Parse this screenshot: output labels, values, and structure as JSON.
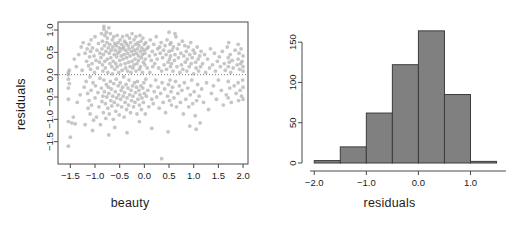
{
  "figure": {
    "width": 519,
    "height": 228,
    "background": "#ffffff",
    "panels": 2
  },
  "chart_data": [
    {
      "id": "scatter-residuals-vs-beauty",
      "type": "scatter",
      "title": "",
      "xlabel": "beauty",
      "ylabel": "residuals",
      "xlim": [
        -1.75,
        2.1
      ],
      "ylim": [
        -2.0,
        1.18
      ],
      "xticks": [
        -1.5,
        -1.0,
        -0.5,
        0.0,
        0.5,
        1.0,
        1.5,
        2.0
      ],
      "xticklabels": [
        "-1.5",
        "-1.0",
        "-0.5",
        "0.0",
        "0.5",
        "1.0",
        "1.5",
        "2.0"
      ],
      "yticks": [
        1.0,
        0.5,
        0.0,
        -0.5,
        -1.0,
        -1.5
      ],
      "yticklabels": [
        "1.0",
        "0.5",
        "0.0",
        "-0.5",
        "-1.0",
        "-1.5"
      ],
      "grid": false,
      "legend": null,
      "point_color": "#a8a8a8",
      "point_opacity": 0.65,
      "point_radius": 1.9,
      "box_frame": true,
      "annotations": [
        {
          "kind": "hline",
          "y": 0.0,
          "style": "dotted",
          "color": "#777777"
        }
      ],
      "n_points": 463,
      "x": [
        -1.54,
        -1.54,
        -1.54,
        -1.54,
        -1.54,
        -1.54,
        -1.54,
        -1.52,
        -1.52,
        -1.5,
        -1.47,
        -1.44,
        -1.42,
        -1.4,
        -1.38,
        -1.36,
        -1.33,
        -1.3,
        -1.28,
        -1.26,
        -1.24,
        -1.22,
        -1.2,
        -1.18,
        -1.17,
        -1.16,
        -1.15,
        -1.14,
        -1.13,
        -1.12,
        -1.12,
        -1.11,
        -1.1,
        -1.1,
        -1.09,
        -1.09,
        -1.08,
        -1.08,
        -1.07,
        -1.06,
        -1.05,
        -1.04,
        -1.03,
        -1.02,
        -1.01,
        -1.0,
        -1.0,
        -0.99,
        -0.98,
        -0.97,
        -0.96,
        -0.95,
        -0.94,
        -0.93,
        -0.92,
        -0.91,
        -0.9,
        -0.9,
        -0.89,
        -0.88,
        -0.87,
        -0.87,
        -0.86,
        -0.86,
        -0.85,
        -0.85,
        -0.84,
        -0.84,
        -0.83,
        -0.83,
        -0.82,
        -0.82,
        -0.81,
        -0.81,
        -0.8,
        -0.8,
        -0.79,
        -0.79,
        -0.78,
        -0.78,
        -0.77,
        -0.77,
        -0.76,
        -0.76,
        -0.75,
        -0.75,
        -0.74,
        -0.74,
        -0.73,
        -0.73,
        -0.72,
        -0.72,
        -0.71,
        -0.71,
        -0.7,
        -0.7,
        -0.69,
        -0.69,
        -0.68,
        -0.68,
        -0.67,
        -0.67,
        -0.66,
        -0.66,
        -0.65,
        -0.65,
        -0.64,
        -0.64,
        -0.63,
        -0.63,
        -0.62,
        -0.62,
        -0.61,
        -0.61,
        -0.6,
        -0.6,
        -0.59,
        -0.59,
        -0.58,
        -0.58,
        -0.57,
        -0.57,
        -0.56,
        -0.56,
        -0.55,
        -0.55,
        -0.54,
        -0.54,
        -0.53,
        -0.53,
        -0.52,
        -0.52,
        -0.51,
        -0.51,
        -0.5,
        -0.5,
        -0.49,
        -0.49,
        -0.48,
        -0.48,
        -0.47,
        -0.47,
        -0.46,
        -0.46,
        -0.45,
        -0.45,
        -0.44,
        -0.44,
        -0.43,
        -0.43,
        -0.42,
        -0.42,
        -0.41,
        -0.41,
        -0.4,
        -0.4,
        -0.39,
        -0.39,
        -0.38,
        -0.38,
        -0.37,
        -0.37,
        -0.36,
        -0.36,
        -0.35,
        -0.35,
        -0.34,
        -0.34,
        -0.33,
        -0.33,
        -0.32,
        -0.32,
        -0.31,
        -0.31,
        -0.3,
        -0.3,
        -0.29,
        -0.29,
        -0.28,
        -0.28,
        -0.27,
        -0.27,
        -0.26,
        -0.26,
        -0.25,
        -0.25,
        -0.24,
        -0.24,
        -0.23,
        -0.23,
        -0.22,
        -0.22,
        -0.21,
        -0.21,
        -0.2,
        -0.2,
        -0.19,
        -0.19,
        -0.18,
        -0.18,
        -0.17,
        -0.17,
        -0.16,
        -0.16,
        -0.15,
        -0.15,
        -0.14,
        -0.14,
        -0.13,
        -0.13,
        -0.12,
        -0.12,
        -0.11,
        -0.11,
        -0.1,
        -0.1,
        -0.09,
        -0.09,
        -0.08,
        -0.08,
        -0.07,
        -0.07,
        -0.06,
        -0.06,
        -0.05,
        -0.05,
        -0.04,
        -0.04,
        -0.03,
        -0.03,
        -0.02,
        -0.02,
        -0.01,
        -0.01,
        0.0,
        0.0,
        0.01,
        0.01,
        0.02,
        0.02,
        0.03,
        0.03,
        0.04,
        0.05,
        0.06,
        0.07,
        0.08,
        0.09,
        0.1,
        0.11,
        0.12,
        0.13,
        0.14,
        0.15,
        0.16,
        0.17,
        0.18,
        0.19,
        0.2,
        0.21,
        0.22,
        0.23,
        0.24,
        0.25,
        0.26,
        0.27,
        0.28,
        0.29,
        0.3,
        0.31,
        0.32,
        0.33,
        0.34,
        0.35,
        0.36,
        0.37,
        0.38,
        0.39,
        0.4,
        0.41,
        0.42,
        0.43,
        0.44,
        0.45,
        0.46,
        0.47,
        0.48,
        0.49,
        0.5,
        0.5,
        0.51,
        0.51,
        0.52,
        0.52,
        0.53,
        0.53,
        0.54,
        0.54,
        0.55,
        0.55,
        0.56,
        0.57,
        0.58,
        0.59,
        0.6,
        0.61,
        0.62,
        0.63,
        0.64,
        0.65,
        0.66,
        0.67,
        0.68,
        0.69,
        0.7,
        0.71,
        0.72,
        0.73,
        0.74,
        0.75,
        0.76,
        0.77,
        0.78,
        0.79,
        0.8,
        0.81,
        0.82,
        0.83,
        0.84,
        0.85,
        0.86,
        0.87,
        0.88,
        0.89,
        0.9,
        0.91,
        0.92,
        0.93,
        0.94,
        0.95,
        0.96,
        0.97,
        0.98,
        0.99,
        1.0,
        1.01,
        1.02,
        1.03,
        1.04,
        1.05,
        1.06,
        1.07,
        1.08,
        1.09,
        1.1,
        1.11,
        1.12,
        1.13,
        1.14,
        1.15,
        1.16,
        1.18,
        1.2,
        1.22,
        1.24,
        1.26,
        1.28,
        1.3,
        1.32,
        1.34,
        1.36,
        1.38,
        1.4,
        1.42,
        1.44,
        1.46,
        1.48,
        1.5,
        1.52,
        1.54,
        1.56,
        1.58,
        1.6,
        1.62,
        1.64,
        1.66,
        1.68,
        1.7,
        1.7,
        1.7,
        1.7,
        1.71,
        1.72,
        1.73,
        1.74,
        1.75,
        1.76,
        1.78,
        1.8,
        1.82,
        1.84,
        1.86,
        1.88,
        1.9,
        1.9,
        1.9,
        1.91,
        1.92,
        1.93,
        1.94,
        1.95,
        1.96,
        1.97,
        1.98,
        1.99,
        2.0,
        2.0,
        2.0,
        2.0,
        2.0,
        1.05,
        0.35,
        -0.82,
        -1.2,
        -0.6,
        0.15,
        0.92,
        -0.35,
        -1.05,
        0.62,
        -0.1,
        0.48,
        -0.72
      ],
      "y": [
        0.05,
        0.0,
        -0.1,
        -0.3,
        -0.55,
        -1.05,
        -1.6,
        0.1,
        -0.2,
        -1.4,
        -1.08,
        -0.95,
        0.35,
        -1.1,
        0.18,
        -0.62,
        0.45,
        -0.45,
        0.62,
        0.1,
        0.72,
        -0.28,
        0.48,
        -0.15,
        0.3,
        0.58,
        -0.42,
        -0.75,
        0.2,
        0.68,
        -0.58,
        0.4,
        -0.05,
        -0.88,
        0.52,
        0.12,
        -0.35,
        0.78,
        -0.68,
        0.25,
        0.6,
        -0.18,
        -1.02,
        0.42,
        0.05,
        -0.52,
        0.85,
        -0.25,
        0.32,
        -0.95,
        0.55,
        0.15,
        -0.4,
        0.7,
        -0.72,
        0.28,
        0.48,
        -0.08,
        -1.12,
        0.38,
        0.92,
        -0.3,
        0.58,
        -0.6,
        0.22,
        0.75,
        -0.48,
        0.08,
        -0.85,
        0.45,
        1.02,
        -0.12,
        0.65,
        -0.38,
        0.3,
        0.88,
        -0.65,
        0.15,
        -0.98,
        0.52,
        0.95,
        -0.22,
        0.72,
        -0.5,
        0.35,
        0.82,
        -0.75,
        0.05,
        -0.28,
        0.6,
        1.05,
        -0.42,
        0.48,
        -0.88,
        0.25,
        0.68,
        -0.15,
        0.92,
        -0.58,
        0.38,
        0.55,
        -0.32,
        0.18,
        -0.7,
        0.78,
        0.02,
        -0.48,
        0.62,
        -1.0,
        0.3,
        0.85,
        -0.2,
        0.45,
        -0.62,
        0.12,
        0.7,
        -0.38,
        0.55,
        -0.82,
        0.25,
        0.65,
        -0.1,
        0.4,
        -0.52,
        0.88,
        0.18,
        -0.68,
        0.48,
        -0.25,
        0.72,
        0.05,
        -0.45,
        0.6,
        -0.9,
        0.32,
        0.52,
        -0.18,
        0.78,
        -0.55,
        0.22,
        0.42,
        -0.35,
        0.68,
        -0.72,
        0.1,
        0.58,
        -0.28,
        0.85,
        -0.48,
        0.35,
        0.62,
        -0.05,
        -0.95,
        0.45,
        0.75,
        -0.4,
        0.25,
        -0.62,
        0.55,
        0.15,
        -0.22,
        0.7,
        -0.78,
        0.38,
        0.88,
        -0.52,
        0.08,
        0.48,
        -0.3,
        0.65,
        -0.68,
        0.28,
        0.58,
        -0.12,
        0.82,
        -0.45,
        0.18,
        0.42,
        -0.85,
        0.72,
        0.05,
        -0.35,
        0.52,
        -0.58,
        0.3,
        0.92,
        -0.25,
        0.62,
        -0.48,
        0.15,
        0.45,
        -0.72,
        0.78,
        0.22,
        -0.18,
        0.55,
        -0.62,
        0.35,
        0.68,
        -0.4,
        0.08,
        0.85,
        -0.28,
        0.48,
        -0.88,
        0.25,
        0.58,
        -0.15,
        0.72,
        -0.55,
        0.32,
        0.42,
        -0.35,
        0.65,
        -0.68,
        0.12,
        0.88,
        -0.45,
        0.52,
        0.18,
        -0.25,
        0.75,
        -0.78,
        0.38,
        0.6,
        -0.52,
        0.05,
        0.45,
        -0.3,
        0.82,
        -0.62,
        0.28,
        0.55,
        -0.18,
        0.68,
        -0.42,
        0.22,
        0.48,
        -0.88,
        0.35,
        0.72,
        -0.1,
        -0.48,
        0.58,
        0.15,
        -0.35,
        0.62,
        -0.72,
        0.42,
        0.05,
        0.78,
        -0.25,
        0.32,
        -0.55,
        0.52,
        0.18,
        -0.65,
        0.68,
        -0.38,
        0.25,
        0.45,
        -0.12,
        0.85,
        -0.5,
        0.35,
        0.58,
        -0.28,
        0.15,
        -0.75,
        0.62,
        0.48,
        -0.42,
        0.72,
        0.08,
        -0.18,
        0.38,
        -0.62,
        0.55,
        0.22,
        -0.32,
        0.65,
        -0.85,
        0.45,
        0.12,
        0.78,
        -0.48,
        0.28,
        -0.22,
        0.95,
        0.52,
        0.35,
        -0.58,
        0.68,
        -0.12,
        0.18,
        0.42,
        -0.38,
        0.72,
        -0.68,
        0.25,
        0.55,
        -0.28,
        0.08,
        0.62,
        -0.52,
        0.32,
        0.45,
        -0.15,
        0.85,
        -0.72,
        0.18,
        0.58,
        -0.42,
        0.38,
        0.68,
        -0.25,
        0.05,
        -0.62,
        0.48,
        0.22,
        -0.35,
        0.75,
        0.12,
        -0.88,
        0.42,
        -0.18,
        0.65,
        0.28,
        -0.55,
        0.52,
        0.08,
        0.35,
        -0.3,
        0.62,
        -0.72,
        0.18,
        0.45,
        -0.45,
        0.72,
        0.25,
        -0.12,
        0.38,
        -0.65,
        0.55,
        0.02,
        -0.38,
        0.48,
        -0.92,
        0.28,
        0.15,
        -0.58,
        0.62,
        -0.22,
        0.35,
        0.08,
        -0.48,
        0.42,
        -1.08,
        0.18,
        0.52,
        -0.32,
        0.25,
        -0.62,
        0.45,
        0.05,
        -0.18,
        0.35,
        -0.78,
        0.15,
        0.58,
        -0.42,
        0.22,
        -0.25,
        0.48,
        0.08,
        -0.55,
        0.3,
        -0.12,
        0.4,
        0.18,
        -0.35,
        0.52,
        -0.68,
        0.25,
        0.1,
        -0.45,
        0.62,
        0.38,
        0.18,
        -0.15,
        -0.52,
        0.72,
        0.28,
        -0.3,
        0.45,
        0.05,
        -0.62,
        0.32,
        0.15,
        -0.25,
        0.55,
        -0.42,
        0.22,
        0.68,
        0.35,
        -0.18,
        -0.58,
        0.48,
        0.12,
        -0.35,
        0.25,
        0.58,
        -0.48,
        0.3,
        -0.12,
        0.42,
        0.18,
        -0.28,
        0.08,
        -0.55,
        -1.22,
        -1.88,
        1.08,
        -1.12,
        -1.18,
        -1.2,
        -1.15,
        -1.3,
        -1.25,
        0.92,
        -1.05,
        -1.28,
        -1.35
      ]
    },
    {
      "id": "histogram-residuals",
      "type": "bar",
      "subtype": "histogram",
      "title": "",
      "xlabel": "residuals",
      "ylabel": "Frequency",
      "xlim": [
        -2.12,
        1.72
      ],
      "ylim": [
        0,
        175
      ],
      "xticks": [
        -2.0,
        -1.0,
        0.0,
        1.0
      ],
      "xticklabels": [
        "-2.0",
        "-1.0",
        "0.0",
        "1.0"
      ],
      "yticks": [
        0,
        50,
        100,
        150
      ],
      "yticklabels": [
        "0",
        "50",
        "100",
        "150"
      ],
      "grid": false,
      "legend": null,
      "bin_width": 0.5,
      "bin_edges": [
        -2.0,
        -1.5,
        -1.0,
        -0.5,
        0.0,
        0.5,
        1.0,
        1.5
      ],
      "categories": [
        "[-2.0,-1.5)",
        "[-1.5,-1.0)",
        "[-1.0,-0.5)",
        "[-0.5,0.0)",
        "[0.0,0.5)",
        "[0.5,1.0)",
        "[1.0,1.5)"
      ],
      "values": [
        3,
        20,
        62,
        122,
        164,
        85,
        2
      ],
      "bar_fill": "#808080",
      "bar_stroke": "#3c3c3c"
    }
  ]
}
